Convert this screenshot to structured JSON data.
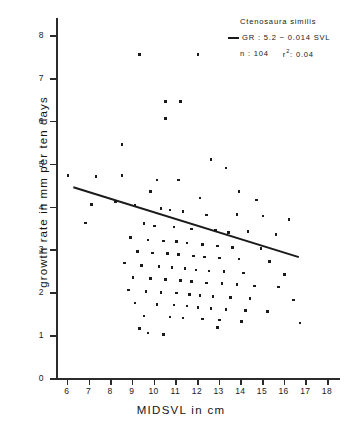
{
  "chart_data": {
    "type": "scatter",
    "title": "",
    "xlabel": "MIDSVL in cm",
    "ylabel": "growth rate in mm per ten days",
    "xlim": [
      5.5,
      18.6
    ],
    "ylim": [
      0,
      8.4
    ],
    "xticks": [
      6,
      7,
      8,
      9,
      10,
      11,
      12,
      13,
      14,
      15,
      16,
      17,
      18
    ],
    "yticks": [
      0,
      1,
      2,
      3,
      4,
      5,
      6,
      7,
      8
    ],
    "grid": false,
    "legend_position": "top-right",
    "series": [
      {
        "name": "Ctenosaura similis",
        "marker": "square",
        "points": [
          [
            9.35,
            7.55
          ],
          [
            12.05,
            7.55
          ],
          [
            10.55,
            6.45
          ],
          [
            11.25,
            6.45
          ],
          [
            10.55,
            6.05
          ],
          [
            8.55,
            5.45
          ],
          [
            12.65,
            5.1
          ],
          [
            6.05,
            4.72
          ],
          [
            7.35,
            4.7
          ],
          [
            8.55,
            4.72
          ],
          [
            10.15,
            4.62
          ],
          [
            11.15,
            4.62
          ],
          [
            13.35,
            4.9
          ],
          [
            9.85,
            4.35
          ],
          [
            13.95,
            4.35
          ],
          [
            12.15,
            4.2
          ],
          [
            14.75,
            4.15
          ],
          [
            7.15,
            4.05
          ],
          [
            8.25,
            4.12
          ],
          [
            9.15,
            4.02
          ],
          [
            10.35,
            3.95
          ],
          [
            10.75,
            3.92
          ],
          [
            11.35,
            3.88
          ],
          [
            12.45,
            3.8
          ],
          [
            13.85,
            3.82
          ],
          [
            15.05,
            3.78
          ],
          [
            16.25,
            3.7
          ],
          [
            6.85,
            3.62
          ],
          [
            9.55,
            3.6
          ],
          [
            10.05,
            3.55
          ],
          [
            10.95,
            3.52
          ],
          [
            11.75,
            3.48
          ],
          [
            12.85,
            3.45
          ],
          [
            13.45,
            3.4
          ],
          [
            14.35,
            3.42
          ],
          [
            15.65,
            3.35
          ],
          [
            8.95,
            3.28
          ],
          [
            9.75,
            3.22
          ],
          [
            10.45,
            3.2
          ],
          [
            11.05,
            3.18
          ],
          [
            11.55,
            3.15
          ],
          [
            12.25,
            3.12
          ],
          [
            12.95,
            3.08
          ],
          [
            13.65,
            3.05
          ],
          [
            14.95,
            3.02
          ],
          [
            9.25,
            2.95
          ],
          [
            9.95,
            2.92
          ],
          [
            10.65,
            2.9
          ],
          [
            11.15,
            2.88
          ],
          [
            11.85,
            2.85
          ],
          [
            12.35,
            2.82
          ],
          [
            13.05,
            2.8
          ],
          [
            13.95,
            2.78
          ],
          [
            15.35,
            2.72
          ],
          [
            8.65,
            2.68
          ],
          [
            9.45,
            2.62
          ],
          [
            10.25,
            2.6
          ],
          [
            10.85,
            2.58
          ],
          [
            11.45,
            2.55
          ],
          [
            11.95,
            2.52
          ],
          [
            12.55,
            2.5
          ],
          [
            13.25,
            2.48
          ],
          [
            14.15,
            2.45
          ],
          [
            16.05,
            2.42
          ],
          [
            9.05,
            2.35
          ],
          [
            9.85,
            2.32
          ],
          [
            10.55,
            2.3
          ],
          [
            11.25,
            2.28
          ],
          [
            11.75,
            2.25
          ],
          [
            12.45,
            2.22
          ],
          [
            13.15,
            2.2
          ],
          [
            13.85,
            2.18
          ],
          [
            14.65,
            2.15
          ],
          [
            15.75,
            2.12
          ],
          [
            8.85,
            2.05
          ],
          [
            9.65,
            2.02
          ],
          [
            10.35,
            2.0
          ],
          [
            11.05,
            1.98
          ],
          [
            11.65,
            1.95
          ],
          [
            12.15,
            1.92
          ],
          [
            12.75,
            1.9
          ],
          [
            13.55,
            1.88
          ],
          [
            14.45,
            1.85
          ],
          [
            16.45,
            1.82
          ],
          [
            9.15,
            1.75
          ],
          [
            10.15,
            1.72
          ],
          [
            10.95,
            1.7
          ],
          [
            11.55,
            1.68
          ],
          [
            12.05,
            1.65
          ],
          [
            12.65,
            1.62
          ],
          [
            13.35,
            1.6
          ],
          [
            14.25,
            1.58
          ],
          [
            15.25,
            1.55
          ],
          [
            9.55,
            1.45
          ],
          [
            10.75,
            1.42
          ],
          [
            11.35,
            1.4
          ],
          [
            12.25,
            1.38
          ],
          [
            13.05,
            1.35
          ],
          [
            14.05,
            1.32
          ],
          [
            16.75,
            1.28
          ],
          [
            9.35,
            1.15
          ],
          [
            12.95,
            1.18
          ],
          [
            9.75,
            1.05
          ],
          [
            10.45,
            1.02
          ]
        ]
      }
    ],
    "regression": {
      "label": "GR : 5.2 − 0.014 SVL",
      "intercept": 5.2,
      "slope_display": -0.014,
      "x_start": 6.3,
      "y_start": 4.45,
      "x_end": 16.7,
      "y_end": 2.82
    },
    "annotations": {
      "species": "Ctenosaura similis",
      "equation": "GR : 5.2 − 0.014 SVL",
      "n_label": "n : 104",
      "r2_label": "r",
      "r2_sup": "2",
      "r2_value": ": 0.04"
    },
    "colors": {
      "marker": "#1a1a1a",
      "line": "#1a1a1a",
      "axis": "#2b2b2b",
      "background": "#ffffff"
    }
  }
}
